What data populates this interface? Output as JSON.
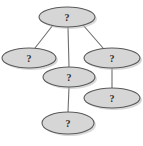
{
  "diagram": {
    "type": "node-link-diagram",
    "canvas": {
      "width": 143,
      "height": 146,
      "background": "#ffffff"
    },
    "style": {
      "node_fill": "#d6d6d6",
      "node_stroke": "#5a5a5a",
      "edge_stroke": "#6e6e6e",
      "label_color": "#2b2b2b",
      "shadow_fill": "#b9b9b9"
    },
    "nodes": [
      {
        "id": "n1",
        "label": "?",
        "name": "node-top",
        "cx": 67,
        "cy": 17,
        "rx": 28,
        "ry": 10
      },
      {
        "id": "n2",
        "label": "?",
        "name": "node-left",
        "cx": 29,
        "cy": 58,
        "rx": 27,
        "ry": 10
      },
      {
        "id": "n3",
        "label": "?",
        "name": "node-right",
        "cx": 112,
        "cy": 58,
        "rx": 28,
        "ry": 10
      },
      {
        "id": "n4",
        "label": "?",
        "name": "node-middle",
        "cx": 69,
        "cy": 77,
        "rx": 26,
        "ry": 10
      },
      {
        "id": "n5",
        "label": "?",
        "name": "node-lower-right",
        "cx": 112,
        "cy": 98,
        "rx": 28,
        "ry": 10
      },
      {
        "id": "n6",
        "label": "?",
        "name": "node-bottom",
        "cx": 68,
        "cy": 123,
        "rx": 26,
        "ry": 11
      }
    ],
    "edges": [
      {
        "id": "e1",
        "name": "edge-top-to-left",
        "from": "n1",
        "to": "n2",
        "x1": 53,
        "y1": 25,
        "x2": 35,
        "y2": 48
      },
      {
        "id": "e2",
        "name": "edge-top-to-middle",
        "from": "n1",
        "to": "n4",
        "x1": 68,
        "y1": 27,
        "x2": 69,
        "y2": 67
      },
      {
        "id": "e3",
        "name": "edge-top-to-right",
        "from": "n1",
        "to": "n3",
        "x1": 83,
        "y1": 25,
        "x2": 103,
        "y2": 48
      },
      {
        "id": "e4",
        "name": "edge-right-to-lower-right",
        "from": "n3",
        "to": "n5",
        "x1": 112,
        "y1": 68,
        "x2": 112,
        "y2": 88
      },
      {
        "id": "e5",
        "name": "edge-middle-to-bottom",
        "from": "n4",
        "to": "n6",
        "x1": 69,
        "y1": 87,
        "x2": 68,
        "y2": 112
      }
    ]
  }
}
